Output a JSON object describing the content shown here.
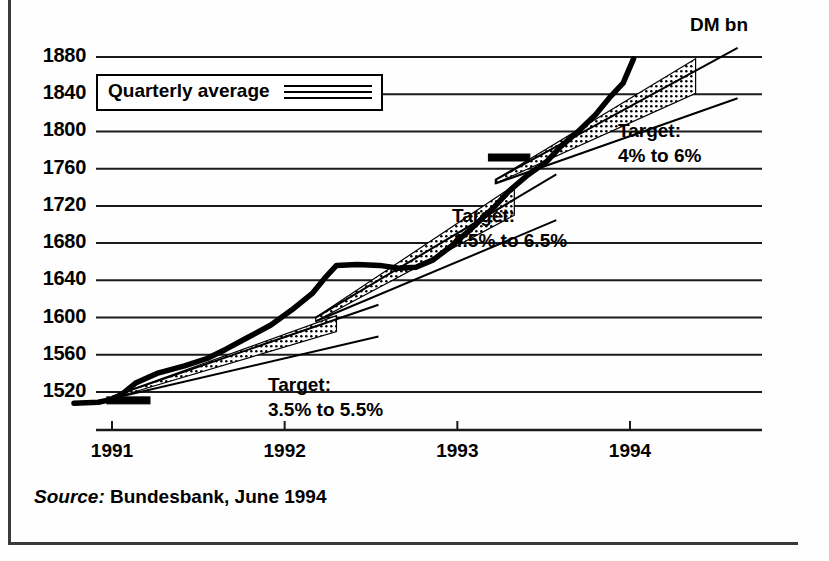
{
  "figure": {
    "unit_label": "DM bn",
    "source_prefix": "Source:",
    "source_text": "Bundesbank, June 1994"
  },
  "legend": {
    "label": "Quarterly average",
    "swatch": "triple-line-icon"
  },
  "annotations": [
    {
      "name": "target-1991",
      "line1": "Target:",
      "line2": "3.5% to 5.5%"
    },
    {
      "name": "target-1992",
      "line1": "Target:",
      "line2": "4.5% to 6.5%"
    },
    {
      "name": "target-1993",
      "line1": "Target:",
      "line2": "4% to 6%"
    }
  ],
  "chart_data": {
    "type": "line",
    "title": "",
    "subtitle": "",
    "xlabel": "",
    "ylabel": "DM bn",
    "ylim": [
      1500,
      1890
    ],
    "xlim": [
      1990.75,
      1994.55
    ],
    "grid": true,
    "legend_position": "top-left",
    "ytick_labels": [
      "1520",
      "1560",
      "1600",
      "1640",
      "1680",
      "1720",
      "1760",
      "1800",
      "1840",
      "1880"
    ],
    "yticks": [
      1520,
      1560,
      1600,
      1640,
      1680,
      1720,
      1760,
      1800,
      1840,
      1880
    ],
    "xtick_labels": [
      "1991",
      "1992",
      "1993",
      "1994"
    ],
    "xticks": [
      1991,
      1992,
      1993,
      1994
    ],
    "series": [
      {
        "name": "Quarterly average",
        "style": "thick-solid",
        "x": [
          1990.78,
          1990.92,
          1991.0,
          1991.06,
          1991.14,
          1991.26,
          1991.42,
          1991.55,
          1991.66,
          1991.78,
          1991.92,
          1992.04,
          1992.16,
          1992.24,
          1992.3,
          1992.42,
          1992.55,
          1992.66,
          1992.76,
          1992.86,
          1992.96,
          1993.06,
          1993.14,
          1993.22,
          1993.3,
          1993.4,
          1993.52,
          1993.6,
          1993.7,
          1993.8,
          1993.88,
          1993.96,
          1994.02
        ],
        "y": [
          1508,
          1509,
          1512,
          1518,
          1530,
          1540,
          1548,
          1556,
          1566,
          1578,
          1592,
          1608,
          1626,
          1644,
          1656,
          1657,
          1656,
          1653,
          1654,
          1662,
          1676,
          1692,
          1706,
          1720,
          1736,
          1752,
          1768,
          1784,
          1800,
          1818,
          1836,
          1852,
          1878
        ]
      }
    ],
    "target_corridors": [
      {
        "name": "target-corridor-1991",
        "label": "Target: 3.5% to 5.5%",
        "lower_pct": 3.5,
        "upper_pct": 5.5,
        "base_value": 1513,
        "x_start": 1991.0,
        "x_end": 1992.3,
        "lower_start": 1513,
        "lower_end": 1585,
        "upper_start": 1515,
        "upper_end": 1602,
        "fill": "stipple"
      },
      {
        "name": "target-corridor-1992",
        "label": "Target: 4.5% to 6.5%",
        "lower_pct": 4.5,
        "upper_pct": 6.5,
        "base_value": 1595,
        "x_start": 1992.18,
        "x_end": 1993.33,
        "lower_start": 1596,
        "lower_end": 1710,
        "upper_start": 1600,
        "upper_end": 1742,
        "fill": "stipple"
      },
      {
        "name": "target-corridor-1993",
        "label": "Target: 4% to 6%",
        "lower_pct": 4.0,
        "upper_pct": 6.0,
        "base_value": 1770,
        "x_start": 1993.22,
        "x_end": 1994.38,
        "lower_start": 1744,
        "lower_end": 1841,
        "upper_start": 1748,
        "upper_end": 1878,
        "fill": "stipple"
      }
    ],
    "base_markers": [
      {
        "name": "base-marker-1991",
        "x_start": 1990.97,
        "x_end": 1991.22,
        "value": 1511
      },
      {
        "name": "base-marker-1993",
        "x_start": 1993.18,
        "x_end": 1993.42,
        "value": 1772
      }
    ]
  }
}
